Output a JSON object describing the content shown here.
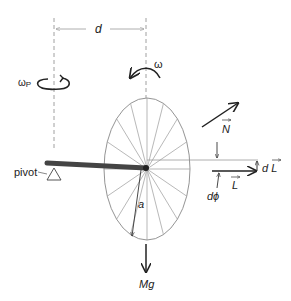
{
  "labels": {
    "d": "d",
    "omega": "ω",
    "omega_p": "ω",
    "omega_p_sub": "P",
    "N": "N",
    "pivot": "pivot",
    "dL_d": "d",
    "dL_L": "L",
    "L": "L",
    "dphi": "dϕ",
    "a": "a",
    "Mg": "Mg"
  },
  "colors": {
    "line": "#888888",
    "dark": "#222222",
    "rod": "#444444"
  },
  "wheel": {
    "spoke_count": 16
  }
}
